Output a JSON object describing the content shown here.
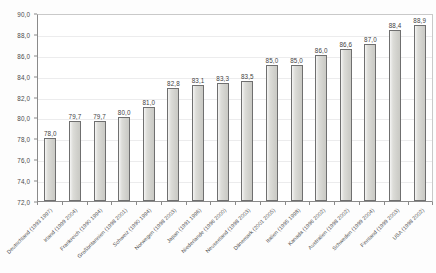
{
  "chart_data": {
    "type": "bar",
    "title": "",
    "subtitle": "",
    "xlabel": "",
    "ylabel": "",
    "ylim": [
      72.0,
      90.0
    ],
    "ytick_step": 2.0,
    "ytick_labels": [
      "90,0",
      "88,0",
      "86,0",
      "84,0",
      "82,0",
      "80,0",
      "78,0",
      "76,0",
      "74,0",
      "72,0"
    ],
    "ytick_values": [
      90.0,
      88.0,
      86.0,
      84.0,
      82.0,
      80.0,
      78.0,
      76.0,
      74.0,
      72.0
    ],
    "grid": true,
    "legend": "none",
    "decimal_separator": ",",
    "categories": [
      "Deutschland (1993 1997)",
      "Irland (1999 2004)",
      "Frankreich (1990 1994)",
      "Großbritannien (1998 2001)",
      "Schweiz (1990 1994)",
      "Norwegen (1998 2003)",
      "Japan (1991 1996)",
      "Niederlande (1996 2000)",
      "Neuseeland (1998 2003)",
      "Dänemark (2001 2005)",
      "Italien (1995 1998)",
      "Kanada (1996 2002)",
      "Australien (1998 2002)",
      "Schweden (1999 2004)",
      "Finnland (1999 2003)",
      "USA (1998 2002)"
    ],
    "values": [
      78.0,
      79.7,
      79.7,
      80.0,
      81.0,
      82.8,
      83.1,
      83.3,
      83.5,
      85.0,
      85.0,
      86.0,
      86.6,
      87.0,
      88.4,
      88.9
    ],
    "value_labels": [
      "78,0",
      "79,7",
      "79,7",
      "80,0",
      "81,0",
      "82,8",
      "83,1",
      "83,3",
      "83,5",
      "85,0",
      "85,0",
      "86,0",
      "86,6",
      "87,0",
      "88,4",
      "88,9"
    ],
    "series": [
      {
        "name": "",
        "values": [
          78.0,
          79.7,
          79.7,
          80.0,
          81.0,
          82.8,
          83.1,
          83.3,
          83.5,
          85.0,
          85.0,
          86.0,
          86.6,
          87.0,
          88.4,
          88.9
        ],
        "bar_fill": "#d6d6d1",
        "bar_border": "#6f6f6f"
      }
    ],
    "colors": {
      "bar_fill": "#d6d6d1",
      "bar_border": "#6f6f6f",
      "gridline": "#ececed",
      "axis": "#8a8a8a",
      "text": "#4a4a4a",
      "plot_background": "#ffffff",
      "page_background": "#fdfdfd"
    }
  }
}
